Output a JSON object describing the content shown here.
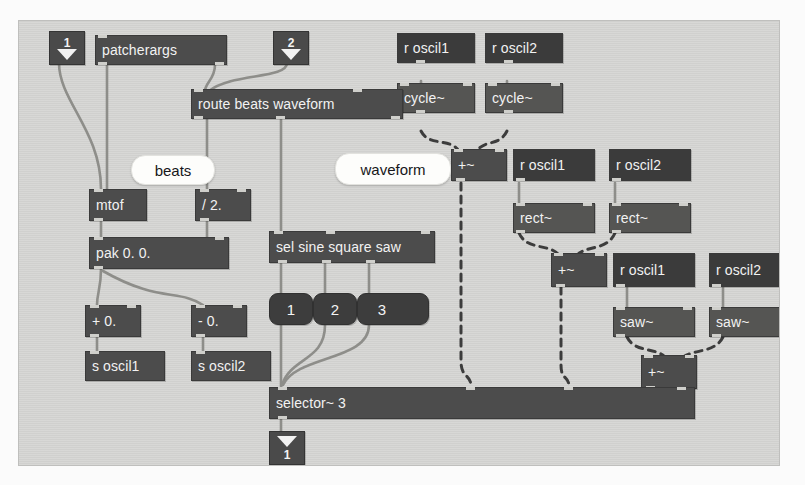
{
  "patcher": {
    "title": "Max patcher",
    "canvas_bg": "#d6d6d4",
    "object_color": "#4c4c4c",
    "message_color": "#3d3d3d",
    "comment_color": "#fdfdfb",
    "signal_wire_color": "#3c3c3c",
    "control_wire_color": "#8e8e8a"
  },
  "inlets": [
    {
      "name": "inlet-1",
      "number": "1"
    },
    {
      "name": "inlet-2",
      "number": "2"
    }
  ],
  "outlets": [
    {
      "name": "outlet-1",
      "number": "1"
    }
  ],
  "objects": {
    "patcherargs": "patcherargs",
    "route": "route beats waveform",
    "mtof": "mtof",
    "divide": "/ 2.",
    "pak": "pak 0. 0.",
    "plus_zero": "+ 0.",
    "minus_zero": "- 0.",
    "send_oscil1": "s oscil1",
    "send_oscil2": "s oscil2",
    "sel": "sel sine square saw",
    "selector": "selector~ 3",
    "recv_cycle1": "r oscil1",
    "recv_cycle2": "r oscil2",
    "cycle1": "cycle~",
    "cycle2": "cycle~",
    "plus_sig_cycle": "+~",
    "recv_rect1": "r oscil1",
    "recv_rect2": "r oscil2",
    "rect1": "rect~",
    "rect2": "rect~",
    "plus_sig_rect": "+~",
    "recv_saw1": "r oscil1",
    "recv_saw2": "r oscil2",
    "saw1": "saw~",
    "saw2": "saw~",
    "plus_sig_saw": "+~"
  },
  "messages": {
    "m1": "1",
    "m2": "2",
    "m3": "3"
  },
  "comments": {
    "beats": "beats",
    "waveform": "waveform"
  }
}
